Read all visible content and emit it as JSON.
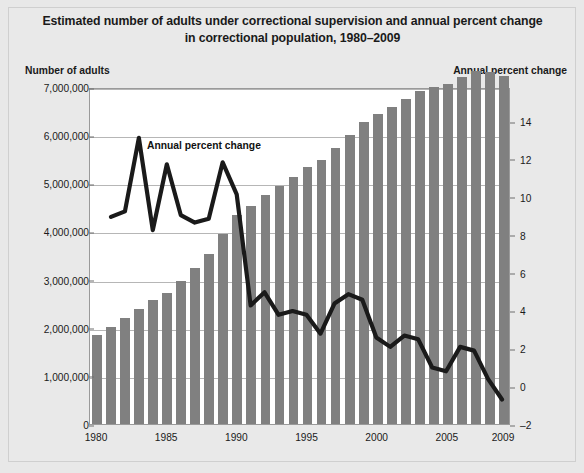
{
  "title": "Estimated number of adults under correctional supervision and annual percent change in correctional population, 1980–2009",
  "left_axis_title": "Number of adults",
  "right_axis_title": "Annual percent change",
  "annotation": "Annual percent change",
  "colors": {
    "bar": "#808080",
    "line": "#1a1a1a",
    "grid": "#b6b6b6",
    "plot_background": "#ffffff",
    "figure_background": "#e8e8e8"
  },
  "chart_data": {
    "type": "bar",
    "title": "Estimated number of adults under correctional supervision and annual percent change in correctional population, 1980–2009",
    "xlabel": "",
    "ylabel": "Number of adults",
    "y2label": "Annual percent change",
    "grid": true,
    "legend": "none",
    "annotations": [
      {
        "text": "Annual percent change",
        "x": 1984,
        "y": 13.2
      }
    ],
    "categories": [
      1980,
      1981,
      1982,
      1983,
      1984,
      1985,
      1986,
      1987,
      1988,
      1989,
      1990,
      1991,
      1992,
      1993,
      1994,
      1995,
      1996,
      1997,
      1998,
      1999,
      2000,
      2001,
      2002,
      2003,
      2004,
      2005,
      2006,
      2007,
      2008,
      2009
    ],
    "xtick_labels": [
      "1980",
      "1985",
      "1990",
      "1995",
      "2000",
      "2005",
      "2009"
    ],
    "xtick_values": [
      1980,
      1985,
      1990,
      1995,
      2000,
      2005,
      2009
    ],
    "ylim": [
      0,
      7000000
    ],
    "yticks": [
      0,
      1000000,
      2000000,
      3000000,
      4000000,
      5000000,
      6000000,
      7000000
    ],
    "ytick_labels": [
      "0",
      "1,000,000",
      "2,000,000",
      "3,000,000",
      "4,000,000",
      "5,000,000",
      "6,000,000",
      "7,000,000"
    ],
    "y2lim": [
      -2,
      15.8
    ],
    "y2ticks": [
      -2,
      0,
      2,
      4,
      6,
      8,
      10,
      12,
      14
    ],
    "y2tick_labels": [
      "–2",
      "0",
      "2",
      "4",
      "6",
      "8",
      "10",
      "12",
      "14"
    ],
    "series": [
      {
        "name": "Number of adults under correctional supervision",
        "type": "bar",
        "axis": "left",
        "values": [
          1840400,
          2006000,
          2192500,
          2387000,
          2585000,
          2731500,
          2981000,
          3240000,
          3530000,
          3949000,
          4350000,
          4536000,
          4763000,
          4944000,
          5141000,
          5335000,
          5483000,
          5725000,
          6003000,
          6280000,
          6445000,
          6581000,
          6758000,
          6925000,
          6995000,
          7053000,
          7199000,
          7339000,
          7312000,
          7225800
        ]
      },
      {
        "name": "Annual percent change",
        "type": "line",
        "axis": "right",
        "values": [
          null,
          9.0,
          9.3,
          13.2,
          8.3,
          11.8,
          9.1,
          8.7,
          8.9,
          11.9,
          10.2,
          4.3,
          5.0,
          3.8,
          4.0,
          3.8,
          2.8,
          4.4,
          4.9,
          4.6,
          2.6,
          2.1,
          2.7,
          2.5,
          1.0,
          0.8,
          2.1,
          1.9,
          0.4,
          -0.7
        ]
      }
    ]
  }
}
